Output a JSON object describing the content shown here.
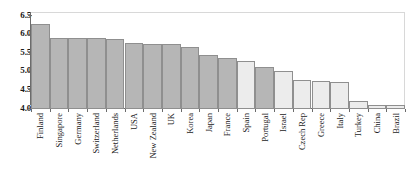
{
  "chart_data": {
    "type": "bar",
    "title": "",
    "subtitle": "",
    "xlabel": "",
    "ylabel": "",
    "ylim": [
      4.0,
      6.5
    ],
    "yticks": [
      "4.0",
      "4.5",
      "5.0",
      "5.5",
      "6.0",
      "6.5"
    ],
    "ytick_values": [
      4.0,
      4.5,
      5.0,
      5.5,
      6.0,
      6.5
    ],
    "grid": false,
    "legend": "none",
    "categories": [
      "Finland",
      "Singapore",
      "Germany",
      "Switzerland",
      "Netherlands",
      "USA",
      "New Zealand",
      "UK",
      "Korea",
      "Japan",
      "France",
      "Spain",
      "Portugal",
      "Israel",
      "Czech Rep",
      "Greece",
      "Italy",
      "Turkey",
      "China",
      "Brazil"
    ],
    "values": [
      6.28,
      5.92,
      5.92,
      5.92,
      5.89,
      5.77,
      5.75,
      5.75,
      5.66,
      5.44,
      5.38,
      5.28,
      5.14,
      5.01,
      4.78,
      4.74,
      4.72,
      4.22,
      4.1,
      4.1
    ],
    "bar_shades": [
      "dark",
      "dark",
      "dark",
      "dark",
      "dark",
      "dark",
      "dark",
      "dark",
      "dark",
      "dark",
      "dark",
      "light",
      "dark",
      "light",
      "light",
      "light",
      "light",
      "light",
      "light",
      "light"
    ],
    "colors": {
      "bar_dark": "#b6b6b6",
      "bar_light": "#ececec",
      "bar_edge": "#8f8f8f",
      "axis": "#6b6b6b",
      "text": "#1a1a1a",
      "background": "#ffffff",
      "frame": "#d8d8d8"
    }
  }
}
